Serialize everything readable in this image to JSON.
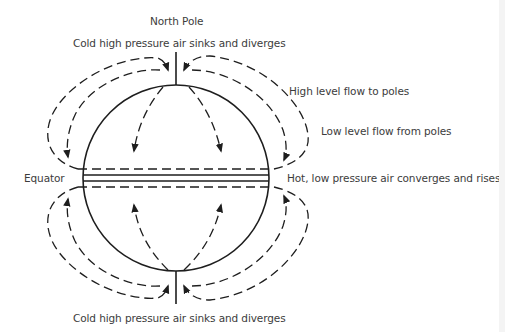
{
  "diagram": {
    "title_top": "North Pole",
    "labels": {
      "north_caption": "Cold high pressure air sinks and diverges",
      "high_level": "High level flow to poles",
      "low_level": "Low level flow from poles",
      "equator": "Equator",
      "equator_caption": "Hot, low pressure air converges and rises",
      "south_caption": "Cold high pressure air sinks and diverges"
    },
    "colors": {
      "background": "#ffffff",
      "line": "#1e1e1e",
      "text": "#3c3c3c"
    },
    "elements": {
      "globe": "circle",
      "equator_lines": "double solid line bounded by dashed lines",
      "north_pole_axis": "vertical line",
      "south_pole_axis": "vertical line",
      "flow_arrows": "dashed arrows showing circulation cells"
    }
  }
}
